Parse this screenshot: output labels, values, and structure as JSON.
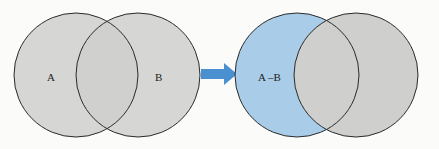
{
  "diagram": {
    "before": {
      "labels": {
        "a": "A",
        "b": "B"
      },
      "fill": "#cfcfcd"
    },
    "arrow": {
      "color": "#4a90d0"
    },
    "after": {
      "labels": {
        "result": "A –B"
      },
      "highlight_fill": "#a9cde8",
      "fill": "#cfcfcd"
    },
    "stroke": "#2a2a2a"
  }
}
